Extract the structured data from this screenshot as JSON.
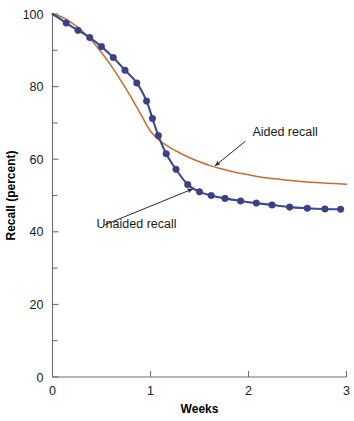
{
  "chart_data": {
    "type": "line",
    "title": "",
    "subtitle": "",
    "xlabel": "Weeks",
    "ylabel": "Recall (percent)",
    "xlim": [
      0,
      3
    ],
    "ylim": [
      0,
      100
    ],
    "grid": false,
    "legend_position": "inline-annotations",
    "x_ticks": [
      "0",
      "1",
      "2",
      "3"
    ],
    "x_tick_values": [
      0,
      1,
      2,
      3
    ],
    "y_ticks": [
      "0",
      "20",
      "40",
      "60",
      "80",
      "100"
    ],
    "y_tick_values": [
      0,
      20,
      40,
      60,
      80,
      100
    ],
    "y_minor_tick_values": [
      10,
      30,
      50,
      70,
      90
    ],
    "annotations": [
      {
        "name": "aided-recall-label",
        "text": "Aided recall",
        "text_x": 2.04,
        "text_y": 66.5,
        "point_x": 1.66,
        "point_y": 58.2
      },
      {
        "name": "unaided-recall-label",
        "text": "Unaided recall",
        "text_x": 0.45,
        "text_y": 41.0,
        "point_x": 1.43,
        "point_y": 51.8
      }
    ],
    "series": [
      {
        "name": "Aided recall",
        "color": "#c96a33",
        "markers": false,
        "x": [
          0.0,
          0.1,
          0.2,
          0.3,
          0.4,
          0.5,
          0.6,
          0.7,
          0.8,
          0.9,
          1.0,
          1.1,
          1.2,
          1.3,
          1.4,
          1.5,
          1.6,
          1.7,
          1.8,
          1.9,
          2.0,
          2.2,
          2.4,
          2.6,
          2.8,
          3.0
        ],
        "values": [
          100.0,
          99.1,
          97.5,
          95.4,
          92.7,
          89.4,
          85.7,
          81.6,
          77.2,
          72.4,
          67.7,
          65.0,
          63.2,
          61.7,
          60.4,
          59.3,
          58.3,
          57.5,
          56.8,
          56.2,
          55.7,
          54.8,
          54.2,
          53.7,
          53.4,
          53.1
        ]
      },
      {
        "name": "Unaided recall",
        "color": "#3b4a8c",
        "markers": true,
        "marker_color": "#3a3f86",
        "x": [
          0.0,
          0.14,
          0.26,
          0.38,
          0.5,
          0.62,
          0.74,
          0.86,
          0.96,
          1.02,
          1.08,
          1.16,
          1.26,
          1.38,
          1.5,
          1.62,
          1.76,
          1.92,
          2.08,
          2.24,
          2.42,
          2.6,
          2.78,
          2.94
        ],
        "values": [
          100.0,
          97.5,
          95.5,
          93.5,
          91.0,
          88.0,
          84.5,
          81.0,
          76.0,
          71.2,
          66.5,
          61.5,
          57.2,
          53.0,
          51.0,
          50.0,
          49.2,
          48.5,
          47.9,
          47.4,
          46.8,
          46.5,
          46.3,
          46.2
        ],
        "marker_x": [
          0.14,
          0.26,
          0.38,
          0.5,
          0.62,
          0.74,
          0.86,
          0.96,
          1.02,
          1.08,
          1.16,
          1.26,
          1.38,
          1.5,
          1.62,
          1.76,
          1.92,
          2.08,
          2.24,
          2.42,
          2.6,
          2.78,
          2.94
        ],
        "marker_values": [
          97.5,
          95.5,
          93.5,
          91.0,
          88.0,
          84.5,
          81.0,
          76.0,
          71.2,
          66.5,
          61.5,
          57.2,
          53.0,
          51.0,
          50.0,
          49.2,
          48.5,
          47.9,
          47.4,
          46.8,
          46.5,
          46.3,
          46.2
        ]
      }
    ]
  },
  "colors": {
    "background": "#ffffff",
    "axis": "#6e6e6e",
    "text": "#1a1a1a",
    "aided": "#c96a33",
    "unaided": "#3b4a8c"
  }
}
